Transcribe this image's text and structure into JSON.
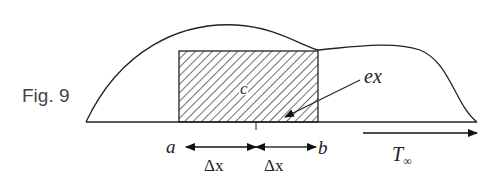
{
  "figure": {
    "caption": "Fig. 9",
    "labels": {
      "center": "c",
      "annotation": "ex",
      "left_point": "a",
      "right_point": "b",
      "left_interval": "Δx",
      "right_interval": "Δx",
      "flow_symbol": "T",
      "flow_subscript": "∞"
    },
    "colors": {
      "stroke": "#222222",
      "background": "#ffffff",
      "text": "#333333"
    }
  }
}
